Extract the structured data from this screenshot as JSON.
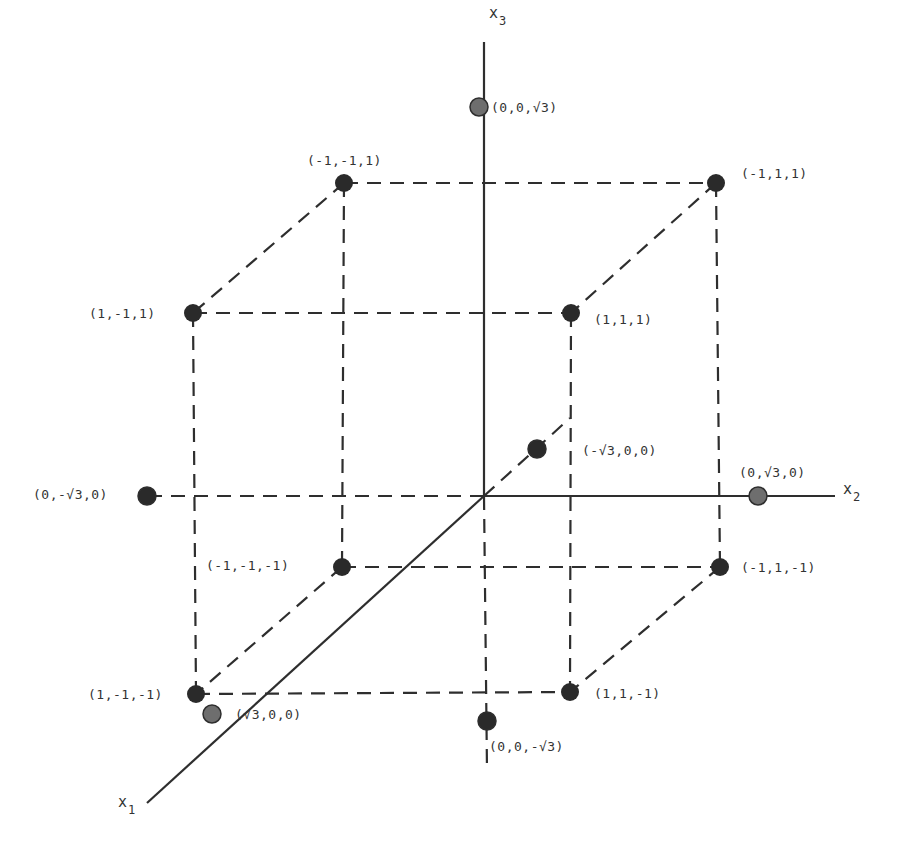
{
  "diagram": {
    "type": "3d-coordinate-cube",
    "origin_px": [
      484,
      496
    ],
    "colors": {
      "line": "#2e2e2e",
      "cube_vertex": "#2a2a2a",
      "axis_point": "#6e6e6e",
      "text": "#333333"
    },
    "axes": [
      {
        "id": "x1",
        "label": "x",
        "sub": "1",
        "solid_from": [
          484,
          496
        ],
        "solid_to": [
          147,
          803
        ],
        "label_pos": [
          118,
          807
        ]
      },
      {
        "id": "x2",
        "label": "x",
        "sub": "2",
        "solid_from": [
          484,
          496
        ],
        "solid_to": [
          835,
          496
        ],
        "label_pos": [
          843,
          494
        ]
      },
      {
        "id": "x3",
        "label": "x",
        "sub": "3",
        "solid_from": [
          484,
          496
        ],
        "solid_to": [
          484,
          42
        ],
        "label_pos": [
          489,
          18
        ]
      }
    ],
    "cube_vertices": [
      {
        "coord": "(-1,-1,1)",
        "px": [
          344,
          183
        ],
        "label": "(-1,-1,1)",
        "label_pos": [
          307,
          165
        ]
      },
      {
        "coord": "(-1,1,1)",
        "px": [
          716,
          183
        ],
        "label": "(-1,1,1)",
        "label_pos": [
          741,
          178
        ]
      },
      {
        "coord": "(1,-1,1)",
        "px": [
          193,
          313
        ],
        "label": "(1,-1,1)",
        "label_pos": [
          89,
          318
        ]
      },
      {
        "coord": "(1,1,1)",
        "px": [
          571,
          313
        ],
        "label": "(1,1,1)",
        "label_pos": [
          594,
          324
        ]
      },
      {
        "coord": "(-1,-1,-1)",
        "px": [
          342,
          567
        ],
        "label": "(-1,-1,-1)",
        "label_pos": [
          206,
          570
        ]
      },
      {
        "coord": "(-1,1,-1)",
        "px": [
          720,
          567
        ],
        "label": "(-1,1,-1)",
        "label_pos": [
          741,
          572
        ]
      },
      {
        "coord": "(1,-1,-1)",
        "px": [
          196,
          694
        ],
        "label": "(1,-1,-1)",
        "label_pos": [
          88,
          699
        ]
      },
      {
        "coord": "(1,1,-1)",
        "px": [
          570,
          692
        ],
        "label": "(1,1,-1)",
        "label_pos": [
          594,
          698
        ]
      }
    ],
    "axis_points": [
      {
        "coord": "(0,0,√3)",
        "px": [
          479,
          107
        ],
        "label": "(0,0,√3)",
        "label_pos": [
          491,
          112
        ]
      },
      {
        "coord": "(0,0,-√3)",
        "px": [
          487,
          721
        ],
        "label": "(0,0,-√3)",
        "label_pos": [
          489,
          751
        ]
      },
      {
        "coord": "(0,-√3,0)",
        "px": [
          147,
          496
        ],
        "label": "(0,-√3,0)",
        "label_pos": [
          33,
          499
        ]
      },
      {
        "coord": "(0,√3,0)",
        "px": [
          758,
          496
        ],
        "label": "(0,√3,0)",
        "label_pos": [
          739,
          477
        ]
      },
      {
        "coord": "(√3,0,0)",
        "px": [
          212,
          714
        ],
        "label": "(√3,0,0)",
        "label_pos": [
          235,
          719
        ]
      },
      {
        "coord": "(-√3,0,0)",
        "px": [
          537,
          449
        ],
        "label": "(-√3,0,0)",
        "label_pos": [
          582,
          455
        ]
      }
    ],
    "dashed_edges": [
      [
        [
          344,
          183
        ],
        [
          716,
          183
        ]
      ],
      [
        [
          193,
          313
        ],
        [
          571,
          313
        ]
      ],
      [
        [
          342,
          567
        ],
        [
          720,
          567
        ]
      ],
      [
        [
          196,
          694
        ],
        [
          570,
          692
        ]
      ],
      [
        [
          344,
          183
        ],
        [
          193,
          313
        ]
      ],
      [
        [
          716,
          183
        ],
        [
          571,
          313
        ]
      ],
      [
        [
          342,
          567
        ],
        [
          196,
          694
        ]
      ],
      [
        [
          720,
          567
        ],
        [
          570,
          692
        ]
      ],
      [
        [
          344,
          183
        ],
        [
          342,
          567
        ]
      ],
      [
        [
          716,
          183
        ],
        [
          720,
          567
        ]
      ],
      [
        [
          193,
          313
        ],
        [
          196,
          694
        ]
      ],
      [
        [
          571,
          313
        ],
        [
          570,
          692
        ]
      ],
      [
        [
          484,
          496
        ],
        [
          147,
          496
        ]
      ],
      [
        [
          484,
          496
        ],
        [
          487,
          770
        ]
      ],
      [
        [
          484,
          496
        ],
        [
          570,
          418
        ]
      ]
    ]
  }
}
